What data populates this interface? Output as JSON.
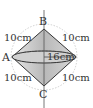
{
  "figure": {
    "points": {
      "A": "A",
      "B": "B",
      "C": "C"
    },
    "edges": {
      "top_left": "10cm",
      "top_right": "10cm",
      "bottom_left": "10cm",
      "bottom_right": "10cm",
      "diameter": "16cm"
    },
    "colors": {
      "solid_fill": "#c8c8c8",
      "edge": "#333333",
      "dotted_circle": "#aaaaaa"
    }
  }
}
